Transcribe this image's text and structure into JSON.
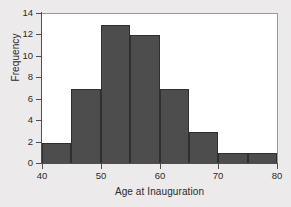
{
  "chart_data": {
    "type": "bar",
    "subtype": "histogram",
    "title": "",
    "xlabel": "Age at Inauguration",
    "ylabel": "Frequency",
    "bin_width": 5,
    "bin_edges": [
      40,
      45,
      50,
      55,
      60,
      65,
      70,
      75,
      80
    ],
    "categories": [
      "40-45",
      "45-50",
      "50-55",
      "55-60",
      "60-65",
      "65-70",
      "70-75",
      "75-80"
    ],
    "values": [
      2,
      7,
      13,
      12,
      7,
      3,
      1,
      1
    ],
    "xlim": [
      40,
      80
    ],
    "ylim": [
      0,
      14
    ],
    "xticks": [
      40,
      50,
      60,
      70,
      80
    ],
    "yticks": [
      0,
      2,
      4,
      6,
      8,
      10,
      12,
      14
    ],
    "xtick_labels": [
      "40",
      "50",
      "60",
      "70",
      "80"
    ],
    "ytick_labels": [
      "0",
      "2",
      "4",
      "6",
      "8",
      "10",
      "12",
      "14"
    ],
    "grid": false,
    "legend": null,
    "bar_color": "#4d4d4d",
    "bar_edge_color": "#2f2f2f",
    "panel_color": "#ffffff",
    "page_background": "#eceaea",
    "axis_color": "#4f4f4f"
  }
}
